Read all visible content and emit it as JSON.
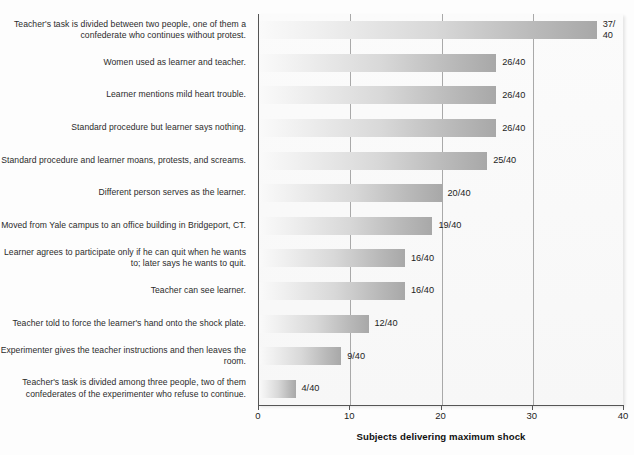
{
  "chart_data": {
    "type": "bar",
    "orientation": "horizontal",
    "title": "",
    "xlabel": "Subjects delivering maximum shock",
    "ylabel": "",
    "xlim": [
      0,
      40
    ],
    "xticks": [
      0,
      10,
      20,
      30,
      40
    ],
    "xtick_labels": [
      "0",
      "10",
      "20",
      "30",
      "40"
    ],
    "grid": "vertical gridlines at 10, 20, 30",
    "legend": "none",
    "denominator": 40,
    "categories": [
      "Teacher's task is divided between two people, one of them a confederate who continues without protest.",
      "Women used as learner and teacher.",
      "Learner mentions mild heart trouble.",
      "Standard procedure but learner says nothing.",
      "Standard procedure and learner moans, protests, and screams.",
      "Different person serves as the learner.",
      "Moved from Yale campus to an office building in Bridgeport, CT.",
      "Learner agrees to participate only if he can quit when he wants to; later says he wants to quit.",
      "Teacher can see learner.",
      "Teacher told to force the learner's hand onto the shock plate.",
      "Experimenter gives the teacher instructions and then leaves the room.",
      "Teacher's task is divided among three people, two of them confederates of the experimenter who refuse to continue."
    ],
    "values": [
      37,
      26,
      26,
      26,
      25,
      20,
      19,
      16,
      16,
      12,
      9,
      4
    ],
    "value_labels": [
      "37/\n40",
      "26/40",
      "26/40",
      "26/40",
      "25/40",
      "20/40",
      "19/40",
      "16/40",
      "16/40",
      "12/40",
      "9/40",
      "4/40"
    ],
    "bar_color_start": "#fafafa",
    "bar_color_end": "#a8a8a8",
    "axis_color": "#555555",
    "gridline_color": "#a9a9a9",
    "background_color": "#fdfdfd"
  }
}
